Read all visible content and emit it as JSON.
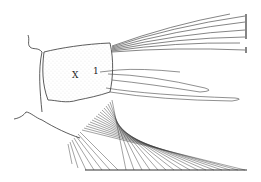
{
  "figure": {
    "type": "anatomical line drawing",
    "labels": [
      {
        "text": "X",
        "x": 72,
        "y": 71
      },
      {
        "text": "1",
        "x": 94,
        "y": 68
      }
    ],
    "colors": {
      "ink": "#222222",
      "stipple": "#9a9a9a",
      "background": "#ffffff"
    }
  }
}
